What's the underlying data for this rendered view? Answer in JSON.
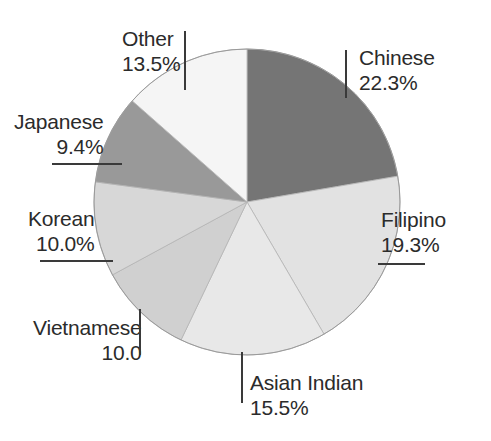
{
  "chart_data": {
    "type": "pie",
    "title": "",
    "xlabel": "",
    "ylabel": "",
    "legend_position": "none",
    "grid": false,
    "start_angle_deg": 0,
    "direction": "clockwise",
    "categories": [
      "Chinese",
      "Filipino",
      "Asian Indian",
      "Vietnamese",
      "Korean",
      "Japanese",
      "Other"
    ],
    "values": [
      22.3,
      19.3,
      15.5,
      10.0,
      10.0,
      9.4,
      13.5
    ],
    "value_labels": [
      "22.3%",
      "19.3%",
      "15.5%",
      "10.0",
      "10.0%",
      "9.4%",
      "13.5%"
    ],
    "colors": [
      "#757575",
      "#e2e2e2",
      "#e8e8e8",
      "#d0d0d0",
      "#d7d7d7",
      "#999999",
      "#f5f5f5"
    ],
    "slices": [
      {
        "name": "Chinese",
        "value": 22.3,
        "value_label": "22.3%",
        "color": "#757575",
        "label_x": 359,
        "label_y": 46,
        "align": "left",
        "leader": {
          "type": "vertical",
          "x": 345,
          "y": 50,
          "length": 48
        }
      },
      {
        "name": "Filipino",
        "value": 19.3,
        "value_label": "19.3%",
        "color": "#e2e2e2",
        "label_x": 381,
        "label_y": 208,
        "align": "left",
        "leader": {
          "type": "horizontal",
          "x": 378,
          "y": 263,
          "length": 47
        }
      },
      {
        "name": "Asian Indian",
        "value": 15.5,
        "value_label": "15.5%",
        "color": "#e8e8e8",
        "label_x": 250,
        "label_y": 371,
        "align": "left",
        "leader": {
          "type": "vertical",
          "x": 241,
          "y": 352,
          "length": 51
        }
      },
      {
        "name": "Vietnamese",
        "value": 10.0,
        "value_label": "10.0",
        "color": "#d0d0d0",
        "label_x": 33,
        "label_y": 316,
        "align": "right",
        "leader": {
          "type": "vertical",
          "x": 139,
          "y": 309,
          "length": 46
        }
      },
      {
        "name": "Korean",
        "value": 10.0,
        "value_label": "10.0%",
        "color": "#d7d7d7",
        "label_x": 28,
        "label_y": 207,
        "align": "right",
        "leader": {
          "type": "horizontal",
          "x": 40,
          "y": 260,
          "length": 73
        }
      },
      {
        "name": "Japanese",
        "value": 9.4,
        "value_label": "9.4%",
        "color": "#999999",
        "label_x": 14,
        "label_y": 110,
        "align": "right",
        "leader": {
          "type": "horizontal",
          "x": 52,
          "y": 163,
          "length": 70
        }
      },
      {
        "name": "Other",
        "value": 13.5,
        "value_label": "13.5%",
        "color": "#f5f5f5",
        "label_x": 122,
        "label_y": 27,
        "align": "left",
        "leader": {
          "type": "vertical",
          "x": 184,
          "y": 31,
          "length": 59
        }
      }
    ],
    "geometry": {
      "cx": 247,
      "cy": 202,
      "r": 153
    }
  }
}
